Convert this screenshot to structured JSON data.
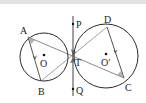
{
  "diagram": {
    "type": "geometry",
    "colors": {
      "stroke": "#2a2a2a",
      "shade": "#9aa0a6",
      "background": "#ffffff"
    },
    "circles": [
      {
        "id": "O",
        "label": "O",
        "cx": 44,
        "cy": 57,
        "r": 24
      },
      {
        "id": "O2",
        "label": "O′",
        "cx": 106,
        "cy": 56,
        "r": 32
      }
    ],
    "points": {
      "A": {
        "label": "A",
        "x": 28,
        "y": 37
      },
      "B": {
        "label": "B",
        "x": 41,
        "y": 81
      },
      "C": {
        "label": "C",
        "x": 124,
        "y": 78
      },
      "D": {
        "label": "D",
        "x": 107,
        "y": 27
      },
      "T": {
        "label": "T",
        "x": 73,
        "y": 57
      },
      "P": {
        "label": "P",
        "x": 73,
        "y": 23
      },
      "Q": {
        "label": "Q",
        "x": 73,
        "y": 89
      }
    },
    "segments": [
      "AB",
      "AC",
      "BD",
      "DC",
      "PQ"
    ]
  }
}
